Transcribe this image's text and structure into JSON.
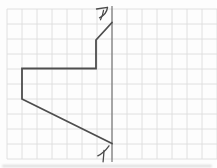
{
  "figure": {
    "background_color": "#fdfdfd",
    "grid": {
      "color": "#dcdcdc",
      "cell_size": 15,
      "x_start": 7,
      "x_end": 217,
      "y_start": 9,
      "y_end": 159,
      "stroke_width": 0.9
    },
    "axis": {
      "x": 112,
      "y_top": 6,
      "y_bottom": 162,
      "color": "#6a6a6a",
      "stroke_width": 1.1
    },
    "shape": {
      "color": "#4e4e4e",
      "stroke_width": 1.8,
      "points": [
        [
          112,
          22.5
        ],
        [
          96,
          40
        ],
        [
          96,
          68.5
        ],
        [
          22,
          68.5
        ],
        [
          22,
          99
        ],
        [
          112,
          143.5
        ]
      ]
    },
    "labels": {
      "top": {
        "text": "ア",
        "color": "#4a4a4a"
      },
      "bottom": {
        "text": "イ",
        "color": "#4a4a4a"
      }
    }
  }
}
